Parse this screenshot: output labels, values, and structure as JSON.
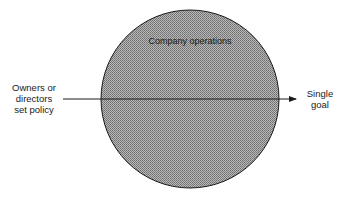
{
  "diagram": {
    "circle_label": "Company operations",
    "left_label_lines": [
      "Owners or",
      "directors",
      "set policy"
    ],
    "right_label_lines": [
      "Single",
      "goal"
    ],
    "colors": {
      "circle_fill": "#9a9a9a",
      "stroke": "#1a1a1a"
    }
  }
}
